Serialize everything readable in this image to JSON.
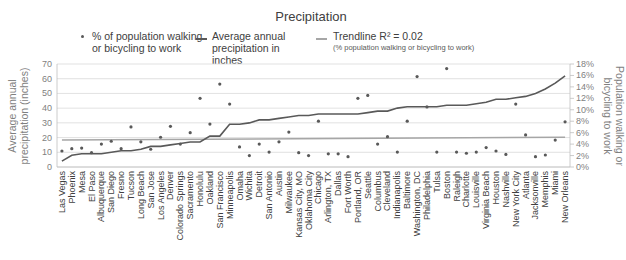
{
  "chart_data": {
    "type": "line",
    "title": "Precipitation",
    "legend": [
      {
        "label": "% of population walking or bicycling to work",
        "marker": "dot",
        "color": "#595959"
      },
      {
        "label": "Average annual precipitation in inches",
        "marker": "line",
        "color": "#595959"
      },
      {
        "label": "Trendline R² = 0.02",
        "sublabel": "(% population walking or bicycling to work)",
        "marker": "line",
        "color": "#a6a6a6"
      }
    ],
    "legend_position": "top",
    "ylabel": "Average annual precipitation (inches)",
    "y2label": "Population walking or bicycling to work",
    "ylim": [
      0,
      70
    ],
    "y2lim": [
      0,
      18
    ],
    "yticks": [
      "0",
      "10",
      "20",
      "30",
      "40",
      "50",
      "60",
      "70"
    ],
    "y2ticks": [
      "0%",
      "2%",
      "4%",
      "6%",
      "8%",
      "10%",
      "12%",
      "14%",
      "16%",
      "18%"
    ],
    "grid": true,
    "categories": [
      "Las Vegas",
      "Phoenix",
      "Mesa",
      "El Paso",
      "Albuquerque",
      "San Diego",
      "Fresno",
      "Tucson",
      "Long Beach",
      "San Jose",
      "Los Angeles",
      "Denver",
      "Colorado Springs",
      "Sacramento",
      "Honolulu",
      "Oakland",
      "San Francisco",
      "Minneapolis",
      "Omaha",
      "Wichita",
      "Detroit",
      "San Antonio",
      "Austin",
      "Milwaukee",
      "Kansas City, MO",
      "Oklahoma City",
      "Chicago",
      "Arlington, TX",
      "Dallas",
      "Fort Worth",
      "Portland, OR",
      "Seattle",
      "Columbus",
      "Cleveland",
      "Indianapolis",
      "Baltimore",
      "Washington, DC",
      "Philadelphia",
      "Tulsa",
      "Boston",
      "Raleigh",
      "Charlotte",
      "Louisville",
      "Virginia Beach",
      "Houston",
      "Nashville",
      "New York City",
      "Atlanta",
      "Jacksonville",
      "Memphis",
      "Miami",
      "New Orleans"
    ],
    "series": [
      {
        "name": "Average annual precipitation in inches",
        "type": "line",
        "axis": "left",
        "values": [
          4,
          8,
          9,
          9,
          9,
          10,
          11,
          11,
          12,
          14,
          14,
          15,
          16,
          17,
          17,
          21,
          21,
          29,
          29,
          30,
          32,
          32,
          33,
          34,
          35,
          35,
          36,
          36,
          36,
          36,
          36,
          37,
          38,
          38,
          40,
          41,
          41,
          41,
          41,
          42,
          42,
          42,
          43,
          44,
          46,
          46,
          47,
          48,
          50,
          53,
          57,
          62
        ]
      },
      {
        "name": "% of population walking or bicycling to work",
        "type": "scatter",
        "axis": "right",
        "values": [
          2.8,
          3.2,
          3.3,
          2.5,
          4.0,
          4.5,
          3.2,
          7.0,
          4.4,
          3.1,
          5.2,
          7.1,
          4.0,
          6.0,
          12.0,
          7.5,
          14.5,
          11.0,
          3.5,
          2.0,
          4.0,
          2.6,
          4.4,
          6.1,
          2.5,
          2.0,
          8.0,
          2.3,
          2.3,
          1.8,
          12.0,
          12.5,
          4.0,
          5.3,
          2.6,
          8.0,
          15.8,
          10.5,
          2.6,
          17.2,
          2.6,
          2.4,
          2.6,
          3.4,
          2.8,
          2.2,
          11.0,
          5.6,
          1.8,
          2.1,
          4.7,
          7.9
        ]
      },
      {
        "name": "Trendline R² = 0.02",
        "type": "line",
        "axis": "right",
        "start": 4.7,
        "end": 5.2
      }
    ]
  },
  "colors": {
    "precip_line": "#595959",
    "dots": "#595959",
    "trendline": "#a6a6a6",
    "grid": "#d9d9d9",
    "axis": "#bfbfbf"
  }
}
